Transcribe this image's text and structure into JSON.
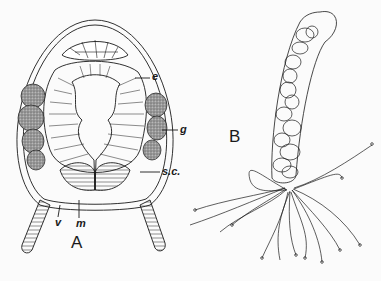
{
  "figure": {
    "panels": [
      {
        "id": "A",
        "label": "A",
        "annotations": [
          {
            "key": "e",
            "text": "e"
          },
          {
            "key": "g",
            "text": "g"
          },
          {
            "key": "sc",
            "text": "s.c."
          },
          {
            "key": "v",
            "text": "v"
          },
          {
            "key": "m",
            "text": "m"
          }
        ]
      },
      {
        "id": "B",
        "label": "B"
      }
    ]
  },
  "labels": {
    "e": "e",
    "g": "g",
    "sc": "s.c.",
    "v": "v",
    "m": "m",
    "A": "A",
    "B": "B"
  },
  "colors": {
    "ink": "#1a1a1a",
    "stipple": "#8a8a8a",
    "background": "#fbfbfb"
  }
}
